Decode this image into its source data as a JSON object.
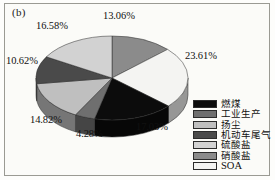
{
  "figure": {
    "panel_label": "(b)"
  },
  "legend": {
    "items": [
      {
        "label": "燃煤",
        "color": "#0c0c0c",
        "latin": false
      },
      {
        "label": "工业生产",
        "color": "#6f6f6f",
        "latin": false
      },
      {
        "label": "扬尘",
        "color": "#bfbfbf",
        "latin": false
      },
      {
        "label": "机动车尾气",
        "color": "#4a4a4a",
        "latin": false
      },
      {
        "label": "硫酸盐",
        "color": "#d2d2d2",
        "latin": false
      },
      {
        "label": "硝酸盐",
        "color": "#8b8b8b",
        "latin": false
      },
      {
        "label": "SOA",
        "color": "#f4f4f2",
        "latin": true
      }
    ]
  },
  "chart_data": {
    "type": "pie",
    "title": "(b)",
    "xlabel": "",
    "ylabel": "",
    "units": "%",
    "total": 100.0,
    "legend_position": "right",
    "grid": false,
    "three_d": true,
    "categories": [
      "燃煤",
      "工业生产",
      "扬尘",
      "机动车尾气",
      "硫酸盐",
      "硝酸盐",
      "SOA"
    ],
    "values": [
      17.03,
      4.28,
      14.82,
      10.62,
      16.58,
      13.06,
      23.61
    ],
    "labels": [
      "17.03%",
      "4.28%",
      "14.82%",
      "10.62%",
      "16.58%",
      "13.06%",
      "23.61%"
    ],
    "colors": [
      "#0c0c0c",
      "#6f6f6f",
      "#bfbfbf",
      "#4a4a4a",
      "#d2d2d2",
      "#8b8b8b",
      "#f4f4f2"
    ],
    "slices": [
      {
        "name": "硝酸盐",
        "value": 13.06,
        "label": "13.06%",
        "color": "#8b8b8b",
        "position": "top"
      },
      {
        "name": "SOA",
        "value": 23.61,
        "label": "23.61%",
        "color": "#f4f4f2",
        "position": "right"
      },
      {
        "name": "燃煤",
        "value": 17.03,
        "label": "17.03%",
        "color": "#0c0c0c",
        "position": "bottom-right"
      },
      {
        "name": "工业生产",
        "value": 4.28,
        "label": "4.28%",
        "color": "#6f6f6f",
        "position": "bottom"
      },
      {
        "name": "扬尘",
        "value": 14.82,
        "label": "14.82%",
        "color": "#bfbfbf",
        "position": "bottom-left"
      },
      {
        "name": "机动车尾气",
        "value": 10.62,
        "label": "10.62%",
        "color": "#4a4a4a",
        "position": "left"
      },
      {
        "name": "硫酸盐",
        "value": 16.58,
        "label": "16.58%",
        "color": "#d2d2d2",
        "position": "top-left"
      }
    ],
    "callouts": [
      {
        "text": "13.06%",
        "left": 103,
        "top": 10
      },
      {
        "text": "23.61%",
        "left": 185,
        "top": 50
      },
      {
        "text": "17.03%",
        "left": 136,
        "top": 121
      },
      {
        "text": "4.28%",
        "left": 76,
        "top": 128
      },
      {
        "text": "14.82%",
        "left": 30,
        "top": 114
      },
      {
        "text": "10.62%",
        "left": 6,
        "top": 55
      },
      {
        "text": "16.58%",
        "left": 36,
        "top": 20
      }
    ]
  }
}
